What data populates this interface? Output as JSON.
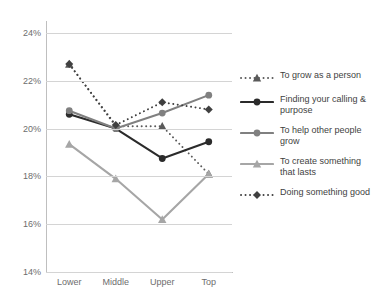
{
  "chart_data": {
    "type": "line",
    "title": "",
    "xlabel": "",
    "ylabel": "",
    "categories": [
      "Lower",
      "Middle",
      "Upper",
      "Top"
    ],
    "ylim": [
      14,
      24
    ],
    "ytick_values": [
      14,
      16,
      18,
      20,
      22,
      24
    ],
    "ytick_labels": [
      "14%",
      "16%",
      "18%",
      "20%",
      "22%",
      "24%"
    ],
    "grid": true,
    "legend_position": "right",
    "series": [
      {
        "name": "To grow as a person",
        "values": [
          22.7,
          20.1,
          20.1,
          18.1
        ],
        "color": "#5a5a5a",
        "style": "dotted",
        "marker": "triangle"
      },
      {
        "name": "Finding your calling & purpose",
        "values": [
          20.6,
          20.0,
          18.75,
          19.45
        ],
        "color": "#2b2b2b",
        "style": "solid",
        "marker": "circle"
      },
      {
        "name": "To help other people grow",
        "values": [
          20.75,
          20.0,
          20.65,
          21.4
        ],
        "color": "#808080",
        "style": "solid",
        "marker": "circle"
      },
      {
        "name": "To create something that lasts",
        "values": [
          19.35,
          17.9,
          16.2,
          18.1
        ],
        "color": "#a6a6a6",
        "style": "solid",
        "marker": "triangle"
      },
      {
        "name": "Doing something good",
        "values": [
          22.7,
          20.15,
          21.1,
          20.8
        ],
        "color": "#404040",
        "style": "dotted",
        "marker": "diamond"
      }
    ]
  },
  "legend": {
    "items": [
      {
        "label": "To grow as a person"
      },
      {
        "label": "Finding your calling & purpose"
      },
      {
        "label": "To help other people grow"
      },
      {
        "label": "To create something that lasts"
      },
      {
        "label": "Doing something good"
      }
    ]
  }
}
